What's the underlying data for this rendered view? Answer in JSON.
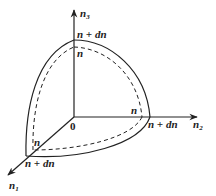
{
  "diagram": {
    "type": "spherical-shell-octant",
    "origin_label": "0",
    "axes": [
      {
        "id": "n1",
        "label": "n",
        "subscript": "1",
        "direction": "down-left"
      },
      {
        "id": "n2",
        "label": "n",
        "subscript": "2",
        "direction": "right"
      },
      {
        "id": "n3",
        "label": "n",
        "subscript": "3",
        "direction": "up"
      }
    ],
    "outer_surface": {
      "style": "solid",
      "radius_label": "n + dn"
    },
    "inner_surface": {
      "style": "dashed",
      "radius_label": "n"
    },
    "labels": {
      "n3_outer": "n + dn",
      "n3_inner": "n",
      "n2_outer": "n + dn",
      "n2_inner": "n",
      "n1_outer": "n + dn",
      "n1_inner": "n"
    },
    "colors": {
      "stroke": "#222222",
      "background": "#ffffff"
    }
  }
}
